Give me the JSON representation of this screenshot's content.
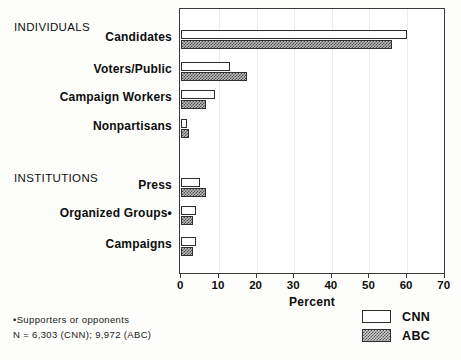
{
  "chart_data": {
    "type": "bar",
    "orientation": "horizontal",
    "title": "",
    "xlabel": "Percent",
    "ylabel": "",
    "xlim": [
      0,
      70
    ],
    "xticks": [
      0,
      10,
      20,
      30,
      40,
      50,
      60,
      70
    ],
    "grid": true,
    "legend_position": "bottom-right",
    "groups": [
      {
        "heading": "INDIVIDUALS",
        "categories": [
          "Candidates",
          "Voters/Public",
          "Campaign Workers",
          "Nonpartisans"
        ]
      },
      {
        "heading": "INSTITUTIONS",
        "categories": [
          "Press",
          "Organized Groups•",
          "Campaigns"
        ]
      }
    ],
    "categories": [
      "Candidates",
      "Voters/Public",
      "Campaign Workers",
      "Nonpartisans",
      "Press",
      "Organized Groups•",
      "Campaigns"
    ],
    "series": [
      {
        "name": "CNN",
        "values": [
          60,
          13,
          9,
          1.5,
          5,
          4,
          4
        ]
      },
      {
        "name": "ABC",
        "values": [
          56,
          17.5,
          6.5,
          2,
          6.5,
          3,
          3
        ]
      }
    ],
    "annotations": [
      "•Supporters or opponents",
      "N = 6,303 (CNN); 9,972 (ABC)"
    ]
  },
  "legend": {
    "items": [
      {
        "label": "CNN",
        "pattern": "open"
      },
      {
        "label": "ABC",
        "pattern": "hatched"
      }
    ]
  },
  "footnotes": {
    "line1": "•Supporters or opponents",
    "line2": "N = 6,303 (CNN); 9,972 (ABC)"
  },
  "axis": {
    "title": "Percent",
    "ticks": [
      "0",
      "10",
      "20",
      "30",
      "40",
      "50",
      "60",
      "70"
    ]
  }
}
